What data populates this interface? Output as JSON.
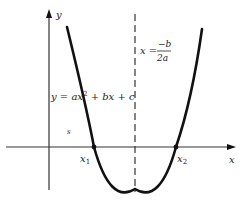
{
  "diagram": {
    "type": "parabola-graph",
    "axes": {
      "x_label": "x",
      "y_label": "y"
    },
    "curve": {
      "equation_lhs": "y = ",
      "equation_label": "y = ax² + bx + c",
      "equation_parts": [
        "y = ax",
        "2",
        " + bx + c"
      ]
    },
    "axis_of_symmetry": {
      "label_lhs": "x = ",
      "numerator": "−b",
      "denominator": "2a"
    },
    "roots": [
      {
        "label": "x",
        "subscript": "1"
      },
      {
        "label": "x",
        "subscript": "2"
      }
    ],
    "stray_mark": "s",
    "colors": {
      "ink": "#111111",
      "axis": "#333333",
      "background": "#ffffff"
    }
  }
}
